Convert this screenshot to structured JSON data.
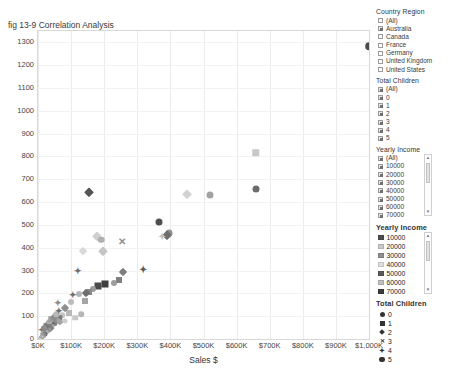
{
  "chart_data": {
    "type": "scatter",
    "title": "fig 13-9 Correlation Analysis",
    "xlabel": "Sales $",
    "ylabel": "",
    "xlim": [
      0,
      1000
    ],
    "ylim": [
      0,
      1350
    ],
    "grid": true,
    "xticks": [
      "$0K",
      "$100K",
      "$200K",
      "$300K",
      "$400K",
      "$500K",
      "$600K",
      "$700K",
      "$800K",
      "$900K",
      "$1,000K"
    ],
    "xtick_values": [
      0,
      100,
      200,
      300,
      400,
      500,
      600,
      700,
      800,
      900,
      1000
    ],
    "yticks": [
      "0",
      "100",
      "200",
      "300",
      "400",
      "500",
      "600",
      "700",
      "800",
      "900",
      "1000",
      "1100",
      "1200",
      "1300"
    ],
    "ytick_values": [
      0,
      100,
      200,
      300,
      400,
      500,
      600,
      700,
      800,
      900,
      1000,
      1100,
      1200,
      1300
    ],
    "color_encoding": "Yearly Income",
    "shape_encoding": "Total Children",
    "points": [
      {
        "x": 997,
        "y": 1288,
        "shape": "circle",
        "color": "#4a4a4a",
        "size": 7.5
      },
      {
        "x": 655,
        "y": 820,
        "shape": "square",
        "color": "#c8c8c8",
        "size": 7.5
      },
      {
        "x": 655,
        "y": 662,
        "shape": "circle",
        "color": "#6b6b6b",
        "size": 7.0
      },
      {
        "x": 517,
        "y": 634,
        "shape": "circle",
        "color": "#a2a2a2",
        "size": 7.0
      },
      {
        "x": 447,
        "y": 640,
        "shape": "diamond",
        "color": "#d2d2d2",
        "size": 6.5
      },
      {
        "x": 150,
        "y": 650,
        "shape": "diamond",
        "color": "#555555",
        "size": 6.5
      },
      {
        "x": 364,
        "y": 517,
        "shape": "circle",
        "color": "#4f4f4f",
        "size": 7.0
      },
      {
        "x": 394,
        "y": 470,
        "shape": "circle",
        "color": "#8d8d8d",
        "size": 7.0
      },
      {
        "x": 387,
        "y": 462,
        "shape": "diamond",
        "color": "#6d6d6d",
        "size": 6.5
      },
      {
        "x": 372,
        "y": 455,
        "shape": "plus",
        "color": "#c0c0c0",
        "size": 6.5
      },
      {
        "x": 175,
        "y": 455,
        "shape": "diamond",
        "color": "#cfcfcf",
        "size": 6.5
      },
      {
        "x": 188,
        "y": 440,
        "shape": "circle",
        "color": "#b0b0b0",
        "size": 6.5
      },
      {
        "x": 252,
        "y": 432,
        "shape": "x",
        "color": "#909090",
        "size": 6.5
      },
      {
        "x": 132,
        "y": 392,
        "shape": "diamond",
        "color": "#d8d8d8",
        "size": 6.0
      },
      {
        "x": 193,
        "y": 388,
        "shape": "diamond",
        "color": "#c5c5c5",
        "size": 6.5
      },
      {
        "x": 313,
        "y": 308,
        "shape": "plus",
        "color": "#5a5a5a",
        "size": 6.5
      },
      {
        "x": 253,
        "y": 300,
        "shape": "diamond",
        "color": "#7d7d7d",
        "size": 6.0
      },
      {
        "x": 243,
        "y": 262,
        "shape": "square",
        "color": "#808080",
        "size": 6.0
      },
      {
        "x": 226,
        "y": 252,
        "shape": "circle",
        "color": "#9d9d9d",
        "size": 6.0
      },
      {
        "x": 200,
        "y": 245,
        "shape": "square",
        "color": "#3f3f3f",
        "size": 7.0
      },
      {
        "x": 178,
        "y": 238,
        "shape": "square",
        "color": "#4a4a4a",
        "size": 7.0
      },
      {
        "x": 163,
        "y": 222,
        "shape": "circle",
        "color": "#9a9a9a",
        "size": 6.0
      },
      {
        "x": 152,
        "y": 212,
        "shape": "square",
        "color": "#8a8a8a",
        "size": 6.0
      },
      {
        "x": 143,
        "y": 205,
        "shape": "diamond",
        "color": "#6e6e6e",
        "size": 6.0
      },
      {
        "x": 140,
        "y": 172,
        "shape": "square",
        "color": "#a5a5a5",
        "size": 6.0
      },
      {
        "x": 120,
        "y": 200,
        "shape": "circle",
        "color": "#b5b5b5",
        "size": 6.0
      },
      {
        "x": 104,
        "y": 196,
        "shape": "plus",
        "color": "#707070",
        "size": 6.0
      },
      {
        "x": 97,
        "y": 168,
        "shape": "circle",
        "color": "#bdbdbd",
        "size": 6.0
      },
      {
        "x": 92,
        "y": 120,
        "shape": "square",
        "color": "#b8b8b8",
        "size": 6.0
      },
      {
        "x": 78,
        "y": 140,
        "shape": "diamond",
        "color": "#8f8f8f",
        "size": 6.0
      },
      {
        "x": 70,
        "y": 108,
        "shape": "circle",
        "color": "#c6c6c6",
        "size": 5.5
      },
      {
        "x": 62,
        "y": 96,
        "shape": "square",
        "color": "#7a7a7a",
        "size": 5.5
      },
      {
        "x": 55,
        "y": 88,
        "shape": "diamond",
        "color": "#9f9f9f",
        "size": 5.5
      },
      {
        "x": 48,
        "y": 74,
        "shape": "circle",
        "color": "#8b8b8b",
        "size": 5.5
      },
      {
        "x": 42,
        "y": 66,
        "shape": "plus",
        "color": "#6a6a6a",
        "size": 5.5
      },
      {
        "x": 38,
        "y": 58,
        "shape": "square",
        "color": "#a8a8a8",
        "size": 5.5
      },
      {
        "x": 33,
        "y": 52,
        "shape": "diamond",
        "color": "#7e7e7e",
        "size": 5.5
      },
      {
        "x": 28,
        "y": 46,
        "shape": "circle",
        "color": "#9b9b9b",
        "size": 5.5
      },
      {
        "x": 24,
        "y": 40,
        "shape": "square",
        "color": "#868686",
        "size": 5.5
      },
      {
        "x": 21,
        "y": 34,
        "shape": "diamond",
        "color": "#b2b2b2",
        "size": 5.0
      },
      {
        "x": 18,
        "y": 28,
        "shape": "circle",
        "color": "#747474",
        "size": 5.0
      },
      {
        "x": 15,
        "y": 24,
        "shape": "plus",
        "color": "#5e5e5e",
        "size": 5.5
      },
      {
        "x": 13,
        "y": 20,
        "shape": "square",
        "color": "#9c9c9c",
        "size": 5.0
      },
      {
        "x": 11,
        "y": 16,
        "shape": "circle",
        "color": "#8f8f8f",
        "size": 5.0
      },
      {
        "x": 9,
        "y": 12,
        "shape": "diamond",
        "color": "#a6a6a6",
        "size": 5.0
      },
      {
        "x": 7,
        "y": 9,
        "shape": "circle",
        "color": "#c0c0c0",
        "size": 4.5
      },
      {
        "x": 6,
        "y": 6,
        "shape": "square",
        "color": "#b4b4b4",
        "size": 4.5
      },
      {
        "x": 5,
        "y": 4,
        "shape": "circle",
        "color": "#a0a0a0",
        "size": 4.5
      },
      {
        "x": 4,
        "y": 2,
        "shape": "diamond",
        "color": "#9a9a9a",
        "size": 4.5
      },
      {
        "x": 3,
        "y": 1,
        "shape": "circle",
        "color": "#cccccc",
        "size": 4.5
      },
      {
        "x": 10,
        "y": 42,
        "shape": "plus",
        "color": "#777777",
        "size": 5.5
      },
      {
        "x": 16,
        "y": 52,
        "shape": "circle",
        "color": "#8a8a8a",
        "size": 5.5
      },
      {
        "x": 20,
        "y": 62,
        "shape": "square",
        "color": "#9090 90",
        "size": 5.5
      },
      {
        "x": 26,
        "y": 70,
        "shape": "diamond",
        "color": "#7b7b7b",
        "size": 5.5
      },
      {
        "x": 31,
        "y": 80,
        "shape": "circle",
        "color": "#adadad",
        "size": 5.5
      },
      {
        "x": 36,
        "y": 92,
        "shape": "square",
        "color": "#9e9e9e",
        "size": 5.5
      },
      {
        "x": 45,
        "y": 100,
        "shape": "diamond",
        "color": "#8c8c8c",
        "size": 5.5
      },
      {
        "x": 52,
        "y": 112,
        "shape": "circle",
        "color": "#b9b9b9",
        "size": 5.5
      },
      {
        "x": 60,
        "y": 126,
        "shape": "plus",
        "color": "#6c6c6c",
        "size": 5.5
      },
      {
        "x": 110,
        "y": 98,
        "shape": "square",
        "color": "#c9c9c9",
        "size": 5.5
      },
      {
        "x": 128,
        "y": 112,
        "shape": "circle",
        "color": "#b6b6b6",
        "size": 5.5
      },
      {
        "x": 64,
        "y": 78,
        "shape": "diamond",
        "color": "#a4a4a4",
        "size": 5.0
      },
      {
        "x": 80,
        "y": 82,
        "shape": "circle",
        "color": "#cdcdcd",
        "size": 5.0
      },
      {
        "x": 57,
        "y": 160,
        "shape": "plus",
        "color": "#8b8b8b",
        "size": 6.0
      },
      {
        "x": 118,
        "y": 300,
        "shape": "plus",
        "color": "#6f6f6f",
        "size": 6.0
      }
    ]
  },
  "filters": {
    "country_region": {
      "title": "Country Region",
      "items": [
        {
          "label": "(All)",
          "checked": false
        },
        {
          "label": "Australia",
          "checked": true
        },
        {
          "label": "Canada",
          "checked": false
        },
        {
          "label": "France",
          "checked": false
        },
        {
          "label": "Germany",
          "checked": false
        },
        {
          "label": "United Kingdom",
          "checked": false
        },
        {
          "label": "United States",
          "checked": false
        }
      ]
    },
    "total_children": {
      "title": "Total Children",
      "items": [
        {
          "label": "(All)",
          "checked": true
        },
        {
          "label": "0",
          "checked": true
        },
        {
          "label": "1",
          "checked": true
        },
        {
          "label": "2",
          "checked": true
        },
        {
          "label": "3",
          "checked": true
        },
        {
          "label": "4",
          "checked": true
        },
        {
          "label": "5",
          "checked": true
        }
      ]
    },
    "yearly_income": {
      "title": "Yearly Income",
      "items": [
        {
          "label": "(All)",
          "checked": true
        },
        {
          "label": "10000",
          "checked": true
        },
        {
          "label": "20000",
          "checked": true
        },
        {
          "label": "30000",
          "checked": true
        },
        {
          "label": "40000",
          "checked": true
        },
        {
          "label": "50000",
          "checked": true
        },
        {
          "label": "60000",
          "checked": true
        },
        {
          "label": "70000",
          "checked": true
        }
      ]
    }
  },
  "legends": {
    "yearly_income": {
      "title": "Yearly Income",
      "items": [
        {
          "label": "10000",
          "color": "#4d4d4d"
        },
        {
          "label": "20000",
          "color": "#c9c9c9"
        },
        {
          "label": "30000",
          "color": "#8f8f8f"
        },
        {
          "label": "40000",
          "color": "#dedede"
        },
        {
          "label": "50000",
          "color": "#5a5a5a"
        },
        {
          "label": "60000",
          "color": "#bfbfbf"
        },
        {
          "label": "70000",
          "color": "#3d3d3d"
        }
      ]
    },
    "total_children": {
      "title": "Total Children",
      "items": [
        {
          "label": "0",
          "shape": "circle"
        },
        {
          "label": "1",
          "shape": "square"
        },
        {
          "label": "2",
          "shape": "diamond"
        },
        {
          "label": "3",
          "shape": "x"
        },
        {
          "label": "4",
          "shape": "star"
        },
        {
          "label": "5",
          "shape": "hex"
        }
      ]
    }
  }
}
